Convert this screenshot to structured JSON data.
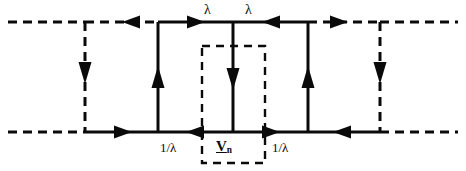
{
  "figure": {
    "type": "state-transition-diagram",
    "colors": {
      "stroke": "#0a0a0a",
      "background": "#ffffff",
      "text": "#0a0a0a"
    },
    "labels": {
      "lambda_left": "λ",
      "lambda_right": "λ",
      "rate_left": "1/λ",
      "rate_right": "1/λ",
      "state_symbol": "V",
      "state_subscript": "n"
    },
    "geometry": {
      "top_line_y": 22,
      "bottom_line_y": 132,
      "left_edge_x": 8,
      "right_edge_x": 458,
      "verticals": [
        {
          "name": "dashed-left",
          "x": 85,
          "style": "dashed",
          "direction": "down"
        },
        {
          "name": "solid-left",
          "x": 158,
          "style": "solid",
          "direction": "up"
        },
        {
          "name": "solid-center",
          "x": 233,
          "style": "solid",
          "direction": "down"
        },
        {
          "name": "solid-right",
          "x": 308,
          "style": "solid",
          "direction": "up"
        },
        {
          "name": "dashed-right",
          "x": 380,
          "style": "dashed",
          "direction": "down"
        }
      ],
      "dashed_box": {
        "x": 202,
        "y": 46,
        "width": 63,
        "height": 117
      }
    },
    "segments": [
      {
        "name": "top-dashed-far-left",
        "style": "dashed",
        "arrow": "none"
      },
      {
        "name": "top-dashed-left",
        "style": "dashed",
        "arrow": "left"
      },
      {
        "name": "top-solid-left",
        "style": "solid",
        "arrow": "right"
      },
      {
        "name": "top-solid-right",
        "style": "solid",
        "arrow": "left"
      },
      {
        "name": "top-dashed-right",
        "style": "dashed",
        "arrow": "right"
      },
      {
        "name": "bottom-dashed-far-left",
        "style": "dashed",
        "arrow": "none"
      },
      {
        "name": "bottom-solid-left",
        "style": "solid",
        "arrow": "right"
      },
      {
        "name": "bottom-solid-center-left",
        "style": "solid",
        "arrow": "left"
      },
      {
        "name": "bottom-solid-center-right",
        "style": "solid",
        "arrow": "right"
      },
      {
        "name": "bottom-solid-right",
        "style": "solid",
        "arrow": "left"
      },
      {
        "name": "bottom-dashed-far-right",
        "style": "dashed",
        "arrow": "none"
      }
    ]
  }
}
